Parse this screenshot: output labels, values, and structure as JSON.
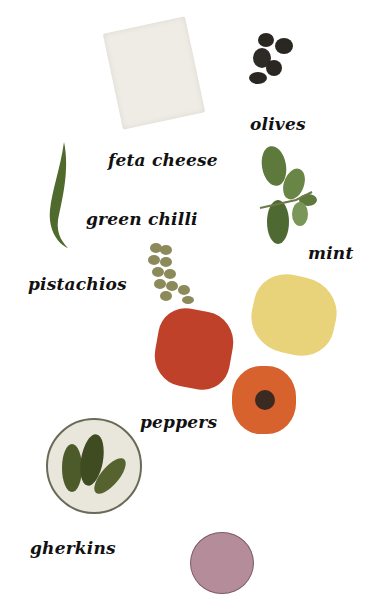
{
  "labels": {
    "olives": "olives",
    "feta": "feta cheese",
    "chilli": "green chilli",
    "mint": "mint",
    "pistachios": "pistachios",
    "peppers": "peppers",
    "gherkins": "gherkins"
  },
  "colors": {
    "feta": "#f3f1ec",
    "olive": "#2a2622",
    "chilli": "#4f6a2c",
    "mint": "#5d7a3c",
    "pistachio": "#8c8a5a",
    "pepper_red": "#c0412a",
    "pepper_yellow": "#e8d27a",
    "pepper_orange": "#d8622e",
    "gherkin": "#4d5a2a",
    "bowl": "#e9e6dc",
    "onion": "#b58c9a"
  }
}
